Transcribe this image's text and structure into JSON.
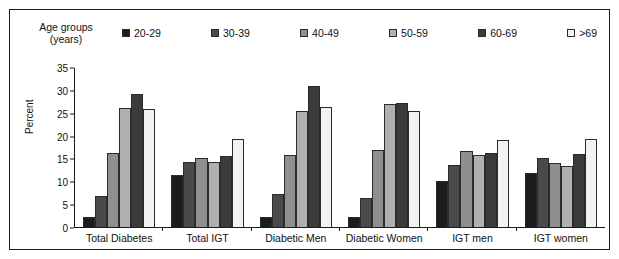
{
  "legend": {
    "title_line1": "Age groups",
    "title_line2": "(years)",
    "items": [
      {
        "label": "20-29",
        "color": "#1c1c1c"
      },
      {
        "label": "30-39",
        "color": "#4a4a4a"
      },
      {
        "label": "40-49",
        "color": "#8f8f8f"
      },
      {
        "label": "50-59",
        "color": "#b0b0b0"
      },
      {
        "label": "60-69",
        "color": "#3b3b3b"
      },
      {
        "label": ">69",
        "color": "#f2f2f2"
      }
    ]
  },
  "chart_data": {
    "type": "bar",
    "title": "",
    "xlabel": "",
    "ylabel": "Percent",
    "ylim": [
      0,
      35
    ],
    "yticks": [
      0,
      5,
      10,
      15,
      20,
      25,
      30,
      35
    ],
    "grid": false,
    "legend_position": "top",
    "categories": [
      "Total Diabetes",
      "Total IGT",
      "Diabetic Men",
      "Diabetic Women",
      "IGT men",
      "IGT women"
    ],
    "series": [
      {
        "name": "20-29",
        "color": "#1c1c1c",
        "values": [
          2.3,
          11.4,
          2.2,
          2.3,
          10.2,
          11.8
        ]
      },
      {
        "name": "30-39",
        "color": "#4a4a4a",
        "values": [
          6.9,
          14.4,
          7.2,
          6.3,
          13.6,
          15.1
        ]
      },
      {
        "name": "40-49",
        "color": "#8f8f8f",
        "values": [
          16.4,
          15.2,
          15.9,
          16.9,
          16.8,
          14.2
        ]
      },
      {
        "name": "50-59",
        "color": "#b0b0b0",
        "values": [
          26.3,
          14.3,
          25.6,
          27.1,
          15.9,
          13.5
        ]
      },
      {
        "name": "60-69",
        "color": "#3b3b3b",
        "values": [
          29.3,
          15.6,
          31.0,
          27.4,
          16.3,
          16.1
        ]
      },
      {
        "name": ">69",
        "color": "#f2f2f2",
        "values": [
          26.0,
          19.3,
          26.4,
          25.6,
          19.2,
          19.3
        ]
      }
    ]
  }
}
